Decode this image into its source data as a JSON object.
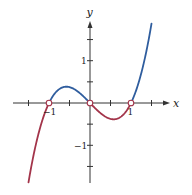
{
  "chart_data": {
    "type": "line",
    "title": "",
    "function": "y = x^3 - x",
    "xlabel": "x",
    "ylabel": "y",
    "xlim": [
      -1.5,
      1.5
    ],
    "ylim": [
      -1.875,
      1.875
    ],
    "x_ticks": [
      -1.5,
      -1,
      -0.5,
      0.5,
      1,
      1.5
    ],
    "y_ticks": [
      -1.5,
      -1,
      -0.5,
      0.5,
      1,
      1.5
    ],
    "x_tick_labels": [
      {
        "value": -1,
        "label": "−1"
      },
      {
        "value": 1,
        "label": "1"
      }
    ],
    "y_tick_labels": [
      {
        "value": 1,
        "label": "1"
      },
      {
        "value": -1,
        "label": "−1"
      }
    ],
    "grid": false,
    "series": [
      {
        "name": "f(x) > 0 (above axis)",
        "color": "#2f5d9e",
        "segments": [
          [
            -1,
            0
          ],
          [
            1,
            1.5
          ]
        ]
      },
      {
        "name": "f(x) < 0 (below axis)",
        "color": "#a3344a",
        "segments": [
          [
            -1.5,
            -1
          ],
          [
            0,
            1
          ]
        ]
      }
    ],
    "zeros": [
      {
        "x": -1,
        "y": 0
      },
      {
        "x": 0,
        "y": 0
      },
      {
        "x": 1,
        "y": 0
      }
    ],
    "points": {
      "x": [
        -1.5,
        -1.0,
        -0.577,
        0,
        0.577,
        1.0,
        1.5
      ],
      "y": [
        -1.875,
        0,
        0.385,
        0,
        -0.385,
        0,
        1.875
      ]
    }
  },
  "labels": {
    "x_axis": "x",
    "y_axis": "y",
    "x_neg1": "−1",
    "x_pos1": "1",
    "y_pos1": "1",
    "y_neg1": "−1"
  },
  "colors": {
    "positive": "#2f5d9e",
    "negative": "#a3344a",
    "axis": "#333333"
  }
}
